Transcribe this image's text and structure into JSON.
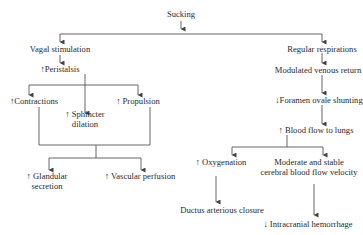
{
  "diagram": {
    "root": "Sucking",
    "left_branch": {
      "vagal": "Vagal stimulation",
      "peristalsis": "↑Peristalsis",
      "contractions": "↑Contractions",
      "sphincter_line1": "↑ Sphincter",
      "sphincter_line2": "dilation",
      "propulsion": "↑ Propulsion",
      "glandular_line1": "↑ Glandular",
      "glandular_line2": "secretion",
      "vascular": "↑ Vascular perfusion"
    },
    "right_branch": {
      "respirations": "Regular respirations",
      "venous": "Modulated venous return",
      "foramen": "↓Foramen ovale shunting",
      "blood_flow": "↑ Blood flow to lungs",
      "oxygenation": "↑ Oxygenation",
      "cerebral_line1": "Moderate and stable",
      "cerebral_line2": "cerebral blood flow velocity",
      "ductus": "Ductus arterious closure",
      "hemorrhage": "↓ Intracranial hemorrhage"
    },
    "line_color": "#555555"
  }
}
